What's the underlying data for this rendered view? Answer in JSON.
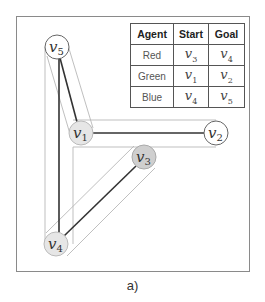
{
  "figure": {
    "caption": "a)",
    "colors": {
      "frame": "#8a8a8a",
      "edge": "#333333",
      "hull": "#b8b8b8",
      "node_white": "#ffffff",
      "node_light": "#e6e6e6",
      "node_dark": "#cfcfcf"
    }
  },
  "graph": {
    "nodes": [
      {
        "id": "v5",
        "base": "v",
        "sub": "5",
        "x": 57,
        "y": 47,
        "fill": "white"
      },
      {
        "id": "v1",
        "base": "v",
        "sub": "1",
        "x": 81,
        "y": 133,
        "fill": "light"
      },
      {
        "id": "v2",
        "base": "v",
        "sub": "2",
        "x": 216,
        "y": 133,
        "fill": "white"
      },
      {
        "id": "v3",
        "base": "v",
        "sub": "3",
        "x": 144,
        "y": 157,
        "fill": "dark"
      },
      {
        "id": "v4",
        "base": "v",
        "sub": "4",
        "x": 56,
        "y": 244,
        "fill": "light"
      }
    ],
    "edges": [
      {
        "from": "v5",
        "to": "v1"
      },
      {
        "from": "v5",
        "to": "v4"
      },
      {
        "from": "v1",
        "to": "v2"
      },
      {
        "from": "v3",
        "to": "v4"
      }
    ]
  },
  "table": {
    "headers": [
      "Agent",
      "Start",
      "Goal"
    ],
    "rows": [
      {
        "agent": "Red",
        "start": {
          "base": "v",
          "sub": "3"
        },
        "goal": {
          "base": "v",
          "sub": "4"
        }
      },
      {
        "agent": "Green",
        "start": {
          "base": "v",
          "sub": "1"
        },
        "goal": {
          "base": "v",
          "sub": "2"
        }
      },
      {
        "agent": "Blue",
        "start": {
          "base": "v",
          "sub": "4"
        },
        "goal": {
          "base": "v",
          "sub": "5"
        }
      }
    ]
  }
}
